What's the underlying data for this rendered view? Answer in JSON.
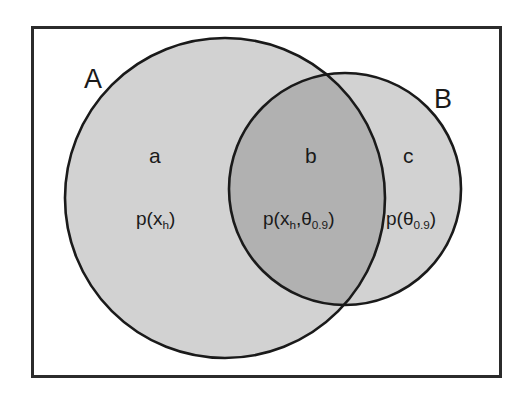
{
  "figure": {
    "type": "venn-diagram",
    "background_color": "#ffffff",
    "frame": {
      "name": "universe-frame",
      "x": 31,
      "y": 26,
      "width": 471,
      "height": 352,
      "stroke_color": "#2b2b2b",
      "stroke_width": 3,
      "fill_color": "#ffffff"
    },
    "sets": [
      {
        "id": "A",
        "label": "A",
        "cx": 225,
        "cy": 198,
        "r": 160,
        "fill_color": "#d2d2d2",
        "stroke_color": "#1a1a1a",
        "stroke_width": 2.6
      },
      {
        "id": "B",
        "label": "B",
        "cx": 345,
        "cy": 189,
        "r": 116,
        "fill_color": "#d2d2d2",
        "stroke_color": "#1a1a1a",
        "stroke_width": 2.6
      }
    ],
    "intersection": {
      "id": "AB",
      "fill_color": "#b1b1b1"
    },
    "regions": [
      {
        "id": "a",
        "label": "a",
        "formula": "p(x_h)",
        "formula_parts": {
          "head": "p(x",
          "sub1": "h",
          "tail": ")"
        },
        "belongs_to": "A only"
      },
      {
        "id": "b",
        "label": "b",
        "formula": "p(x_h,θ_0.9)",
        "formula_parts": {
          "head": "p(x",
          "sub1": "h",
          "mid": ",θ",
          "sub2": "0.9",
          "tail": ")"
        },
        "belongs_to": "A ∩ B"
      },
      {
        "id": "c",
        "label": "c",
        "formula": "p(θ_0.9)",
        "formula_parts": {
          "head": "p(θ",
          "sub2": "0.9",
          "tail": ")"
        },
        "belongs_to": "B only"
      }
    ]
  },
  "labels": {
    "set_a": "A",
    "set_b": "B",
    "region_a": "a",
    "region_b": "b",
    "region_c": "c"
  },
  "formulas": {
    "a": {
      "head": "p(x",
      "sub": "h",
      "tail": ")"
    },
    "b": {
      "head": "p(x",
      "sub1": "h",
      "mid": ",θ",
      "sub2": "0.9",
      "tail": ")"
    },
    "c": {
      "head": "p(θ",
      "sub": "0.9",
      "tail": ")"
    }
  }
}
